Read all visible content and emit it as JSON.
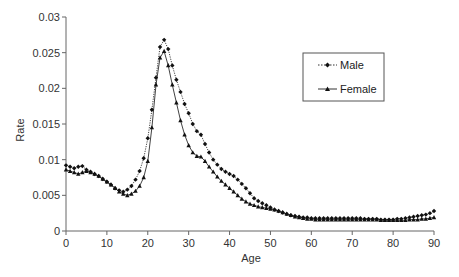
{
  "chart_data": {
    "type": "line",
    "title": "",
    "xlabel": "Age",
    "ylabel": "Rate",
    "xlim": [
      0,
      90
    ],
    "ylim": [
      0,
      0.03
    ],
    "x_ticks": [
      0,
      10,
      20,
      30,
      40,
      50,
      60,
      70,
      80,
      90
    ],
    "x_tick_labels": [
      "0",
      "10",
      "20",
      "30",
      "40",
      "50",
      "60",
      "70",
      "80",
      "90"
    ],
    "y_ticks": [
      0,
      0.005,
      0.01,
      0.015,
      0.02,
      0.025,
      0.03
    ],
    "y_tick_labels": [
      "0",
      "0.005",
      "0.01",
      "0.015",
      "0.02",
      "0.025",
      "0.03"
    ],
    "grid": false,
    "legend_position": "upper right",
    "x": [
      0,
      1,
      2,
      3,
      4,
      5,
      6,
      7,
      8,
      9,
      10,
      11,
      12,
      13,
      14,
      15,
      16,
      17,
      18,
      19,
      20,
      21,
      22,
      23,
      24,
      25,
      26,
      27,
      28,
      29,
      30,
      31,
      32,
      33,
      34,
      35,
      36,
      37,
      38,
      39,
      40,
      41,
      42,
      43,
      44,
      45,
      46,
      47,
      48,
      49,
      50,
      51,
      52,
      53,
      54,
      55,
      56,
      57,
      58,
      59,
      60,
      61,
      62,
      63,
      64,
      65,
      66,
      67,
      68,
      69,
      70,
      71,
      72,
      73,
      74,
      75,
      76,
      77,
      78,
      79,
      80,
      81,
      82,
      83,
      84,
      85,
      86,
      87,
      88,
      89,
      90
    ],
    "series": [
      {
        "name": "Male",
        "line_style": "dotted",
        "marker": "diamond",
        "values": [
          0.0092,
          0.009,
          0.0088,
          0.009,
          0.0091,
          0.0086,
          0.0083,
          0.008,
          0.0077,
          0.0073,
          0.0069,
          0.0065,
          0.006,
          0.0057,
          0.0055,
          0.0058,
          0.0063,
          0.0072,
          0.0084,
          0.0102,
          0.013,
          0.017,
          0.0215,
          0.0258,
          0.0268,
          0.0255,
          0.0232,
          0.0212,
          0.0195,
          0.0178,
          0.0165,
          0.015,
          0.014,
          0.0135,
          0.0122,
          0.011,
          0.01,
          0.0093,
          0.0087,
          0.0083,
          0.008,
          0.0077,
          0.0072,
          0.0066,
          0.006,
          0.0053,
          0.0046,
          0.0042,
          0.0039,
          0.0036,
          0.0033,
          0.003,
          0.0028,
          0.0026,
          0.0024,
          0.0022,
          0.0021,
          0.002,
          0.0019,
          0.0019,
          0.0018,
          0.0018,
          0.0018,
          0.0018,
          0.0018,
          0.0018,
          0.0018,
          0.0018,
          0.0018,
          0.0018,
          0.0018,
          0.0018,
          0.0018,
          0.0017,
          0.0017,
          0.0017,
          0.0017,
          0.0016,
          0.0016,
          0.0016,
          0.0016,
          0.0017,
          0.0017,
          0.0018,
          0.0019,
          0.002,
          0.0021,
          0.0022,
          0.0023,
          0.0025,
          0.0028
        ]
      },
      {
        "name": "Female",
        "line_style": "solid",
        "marker": "triangle",
        "values": [
          0.0086,
          0.0084,
          0.0082,
          0.008,
          0.0082,
          0.0084,
          0.0082,
          0.008,
          0.0077,
          0.0073,
          0.0069,
          0.0065,
          0.006,
          0.0055,
          0.0052,
          0.005,
          0.0052,
          0.0056,
          0.0063,
          0.0075,
          0.0098,
          0.0145,
          0.0205,
          0.0243,
          0.0252,
          0.0232,
          0.0205,
          0.018,
          0.0155,
          0.0135,
          0.012,
          0.011,
          0.0105,
          0.0104,
          0.0098,
          0.009,
          0.0083,
          0.0076,
          0.007,
          0.0065,
          0.006,
          0.0055,
          0.005,
          0.0045,
          0.0041,
          0.0038,
          0.0036,
          0.0034,
          0.0033,
          0.0032,
          0.0031,
          0.003,
          0.0028,
          0.0026,
          0.0024,
          0.0022,
          0.002,
          0.0019,
          0.0018,
          0.0017,
          0.0017,
          0.0016,
          0.0016,
          0.0016,
          0.0016,
          0.0016,
          0.0016,
          0.0016,
          0.0016,
          0.0016,
          0.0016,
          0.0016,
          0.0016,
          0.0016,
          0.0016,
          0.0016,
          0.0016,
          0.0015,
          0.0015,
          0.0015,
          0.0015,
          0.0015,
          0.0015,
          0.0015,
          0.0016,
          0.0016,
          0.0016,
          0.0017,
          0.0017,
          0.0018,
          0.0019
        ]
      }
    ]
  },
  "legend": {
    "items": [
      {
        "label": "Male",
        "style": "dotted",
        "marker": "diamond"
      },
      {
        "label": "Female",
        "style": "solid",
        "marker": "triangle"
      }
    ]
  },
  "colors": {
    "axis": "#666666",
    "series": "#111111",
    "text": "#333333",
    "legend_border": "#555555"
  }
}
